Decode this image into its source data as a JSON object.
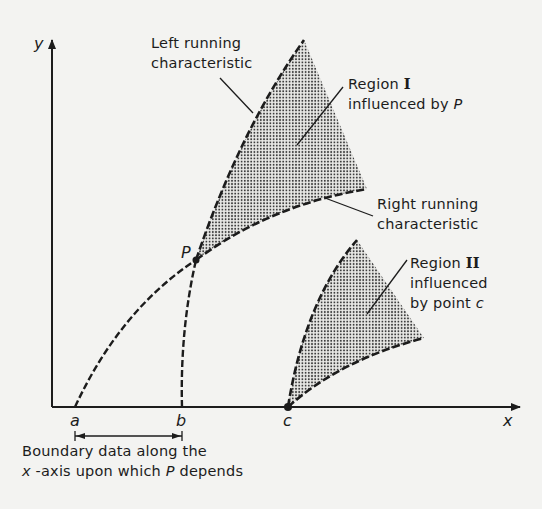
{
  "diagram": {
    "axes": {
      "x_label": "x",
      "y_label": "y"
    },
    "points": {
      "a": "a",
      "b": "b",
      "c": "c",
      "P": "P"
    },
    "labels": {
      "left_char_line1": "Left running",
      "left_char_line2": "characteristic",
      "region1_line1": "Region",
      "region1_numeral": "I",
      "region1_line2": "influenced by",
      "region1_point": "P",
      "right_char_line1": "Right running",
      "right_char_line2": "characteristic",
      "region2_line1": "Region",
      "region2_numeral": "II",
      "region2_line2": "influenced",
      "region2_line3": "by point",
      "region2_point": "c",
      "boundary_line1": "Boundary data along the",
      "boundary_line2_var": "x",
      "boundary_line2_rest": " -axis upon which ",
      "boundary_line2_point": "P",
      "boundary_line2_end": " depends"
    },
    "colors": {
      "ink": "#1c1c1c",
      "paper": "#f3f3f1",
      "stipple": "#3a3a3a"
    }
  }
}
